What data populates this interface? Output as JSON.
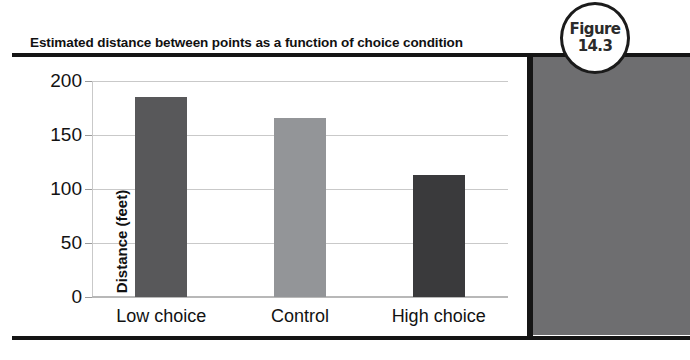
{
  "figure_badge": {
    "line1": "Figure",
    "line2": "14.3"
  },
  "chart_data": {
    "type": "bar",
    "title": "Estimated distance between points as a function of choice condition",
    "xlabel": "",
    "ylabel": "Distance (feet)",
    "categories": [
      "Low choice",
      "Control",
      "High choice"
    ],
    "values": [
      185,
      166,
      113
    ],
    "ylim": [
      0,
      200
    ],
    "yticks": [
      "0",
      "50",
      "100",
      "150",
      "200"
    ],
    "grid": true,
    "legend": "none",
    "bar_colors": [
      "#58585a",
      "#939598",
      "#3a3a3c"
    ]
  },
  "colors": {
    "rule": "#151515",
    "gridline": "#c9c9c9",
    "panel": "#6e6e70",
    "text": "#121212"
  }
}
